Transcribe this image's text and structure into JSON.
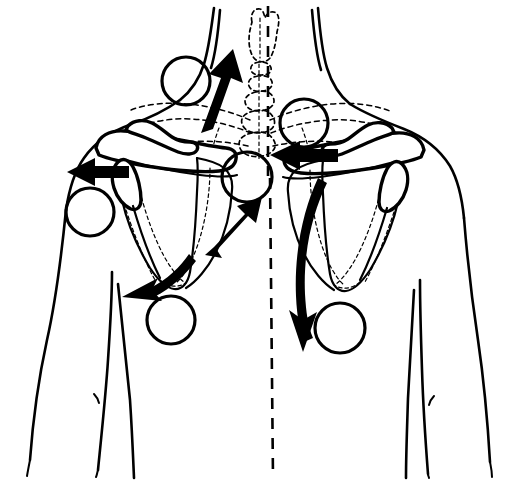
{
  "figure": {
    "view": "posterior",
    "background_color": "#ffffff",
    "line_color": "#000000"
  },
  "anatomy": {
    "body_outline_label": "torso-and-arms-outline",
    "neck_label": "neck",
    "midline_label": "vertical-midline-dashed",
    "spine_label": "spinous-process-column-dashed",
    "occiput_label": "occiput-dashed",
    "ribcage_label": "ribcage-dashed",
    "left_scapula_label": "left-scapula",
    "right_scapula_label": "right-scapula",
    "left_clavicle_label": "left-clavicle",
    "right_clavicle_label": "right-clavicle",
    "left_humerus_label": "left-humerus-head",
    "right_humerus_label": "right-humerus-head"
  },
  "markers": {
    "shape": "circle",
    "stroke": "#000000",
    "fill": "none",
    "count": 8,
    "points": [
      {
        "id": "marker-upper-trapezius-left",
        "cx": 186,
        "cy": 81,
        "r": 24
      },
      {
        "id": "marker-levator-scapulae-right",
        "cx": 304,
        "cy": 123,
        "r": 24
      },
      {
        "id": "marker-deltoid-left",
        "cx": 90,
        "cy": 212,
        "r": 24
      },
      {
        "id": "marker-rhomboid-mid-thoracic",
        "cx": 247,
        "cy": 177,
        "r": 25
      },
      {
        "id": "marker-inferior-angle-left",
        "cx": 171,
        "cy": 320,
        "r": 24
      },
      {
        "id": "marker-inferior-angle-right",
        "cx": 340,
        "cy": 328,
        "r": 25
      }
    ]
  },
  "arrows": {
    "fill": "#000000",
    "count": 6,
    "items": [
      {
        "id": "arrow-elevation-up-left",
        "direction": "up",
        "style": "straight"
      },
      {
        "id": "arrow-retraction-left-lateral",
        "direction": "left",
        "style": "straight"
      },
      {
        "id": "arrow-retraction-right-medial",
        "direction": "left",
        "style": "straight"
      },
      {
        "id": "arrow-upward-rotation-medial",
        "direction": "up-right",
        "style": "straight"
      },
      {
        "id": "arrow-downward-rotation-left",
        "direction": "down-left",
        "style": "curved"
      },
      {
        "id": "arrow-depression-right",
        "direction": "down",
        "style": "curved"
      }
    ]
  }
}
